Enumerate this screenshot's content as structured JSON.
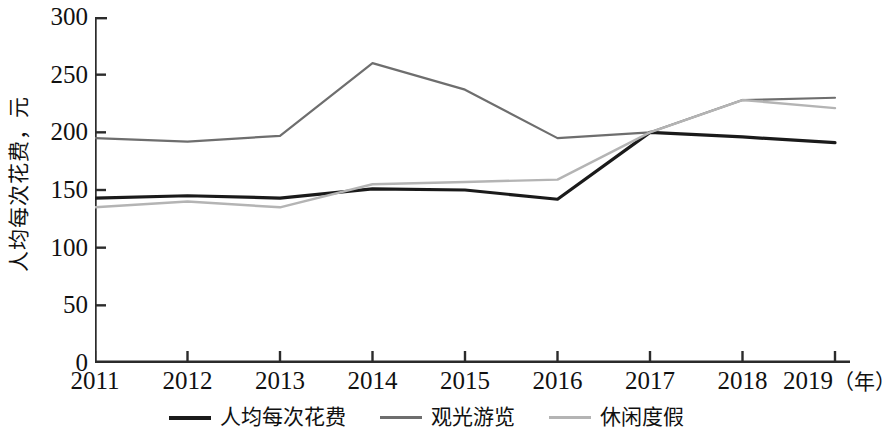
{
  "chart_data": {
    "type": "line",
    "title": "",
    "xlabel": "年",
    "ylabel": "人均每次花费，元",
    "x": [
      "2011",
      "2012",
      "2013",
      "2014",
      "2015",
      "2016",
      "2017",
      "2018",
      "2019"
    ],
    "xlim": [
      2011,
      2019
    ],
    "ylim": [
      0,
      300
    ],
    "yticks": [
      0,
      50,
      100,
      150,
      200,
      250,
      300
    ],
    "ytick_labels": [
      "0",
      "50",
      "100",
      "150",
      "200",
      "250",
      "300"
    ],
    "grid": false,
    "legend_position": "bottom",
    "series": [
      {
        "name": "人均每次花费",
        "color": "#1a1a1a",
        "width": 3.2,
        "values": [
          143,
          145,
          143,
          151,
          150,
          142,
          200,
          196,
          191
        ]
      },
      {
        "name": "观光游览",
        "color": "#6e6e6e",
        "width": 2.2,
        "values": [
          195,
          192,
          197,
          260,
          237,
          195,
          200,
          228,
          230
        ]
      },
      {
        "name": "休闲度假",
        "color": "#b4b4b4",
        "width": 2.4,
        "values": [
          135,
          140,
          135,
          155,
          157,
          159,
          200,
          228,
          221
        ]
      }
    ]
  },
  "axis": {
    "y_title": "人均每次花费，元",
    "x_unit_suffix": "（年）"
  },
  "legend": {
    "items": [
      {
        "label": "人均每次花费",
        "color": "#1a1a1a",
        "width": 4
      },
      {
        "label": "观光游览",
        "color": "#6e6e6e",
        "width": 3
      },
      {
        "label": "休闲度假",
        "color": "#b4b4b4",
        "width": 3
      }
    ]
  },
  "colors": {
    "axis": "#2b2b2b",
    "text": "#111111",
    "background": "#ffffff"
  }
}
